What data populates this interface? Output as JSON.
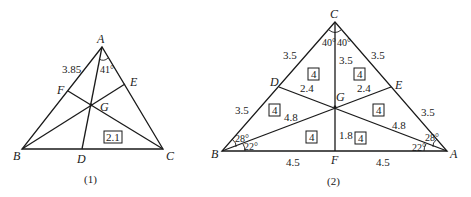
{
  "figure1": {
    "caption": "(1)",
    "vertices": {
      "A": "A",
      "B": "B",
      "C": "C",
      "D": "D",
      "E": "E",
      "F": "F",
      "G": "G"
    },
    "labels": {
      "side_AF": "3.85",
      "angle_A": "41°",
      "area_box": "2.1"
    }
  },
  "figure2": {
    "caption": "(2)",
    "vertices": {
      "A": "A",
      "B": "B",
      "C": "C",
      "D": "D",
      "E": "E",
      "F": "F",
      "G": "G"
    },
    "labels": {
      "CD": "3.5",
      "DB": "3.5",
      "CE": "3.5",
      "EA": "3.5",
      "CG": "3.5",
      "DG": "2.4",
      "EG": "2.4",
      "BG": "4.8",
      "AG": "4.8",
      "GF": "1.8",
      "BF": "4.5",
      "FA": "4.5",
      "angle_C_left": "40°",
      "angle_C_right": "40°",
      "angle_B_upper": "28°",
      "angle_B_lower": "22°",
      "angle_A_upper": "28°",
      "angle_A_lower": "22°"
    },
    "area_boxes": [
      "4",
      "4",
      "4",
      "4",
      "4",
      "4"
    ]
  }
}
